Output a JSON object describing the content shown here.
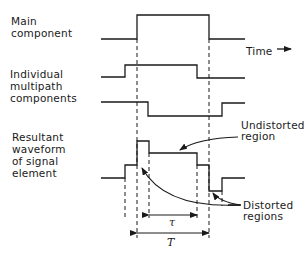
{
  "labels": {
    "main_component": "Main\ncomponent",
    "multipath_components": "Individual\nmultipath\ncomponents",
    "resultant_waveform": "Resultant\nwaveform\nof signal\nelement",
    "time_axis": "Time",
    "undistorted_region": "Undistorted\nregion",
    "distorted_regions": "Distorted\nregions",
    "tau_symbol": "τ",
    "T_symbol": "T"
  },
  "waveforms": {
    "main_component": [
      [
        101,
        39
      ],
      [
        137,
        39
      ],
      [
        137,
        15
      ],
      [
        209,
        15
      ],
      [
        209,
        39
      ],
      [
        245,
        39
      ]
    ],
    "multipath_component_1": [
      [
        101,
        77
      ],
      [
        125,
        77
      ],
      [
        125,
        65
      ],
      [
        197,
        65
      ],
      [
        197,
        78
      ],
      [
        245,
        78
      ]
    ],
    "multipath_component_2": [
      [
        101,
        102
      ],
      [
        148,
        102
      ],
      [
        148,
        116
      ],
      [
        222,
        116
      ],
      [
        222,
        103
      ],
      [
        245,
        103
      ]
    ],
    "resultant": [
      [
        101,
        178
      ],
      [
        125,
        178
      ],
      [
        125,
        165
      ],
      [
        137,
        165
      ],
      [
        137,
        141
      ],
      [
        149,
        141
      ],
      [
        149,
        153
      ],
      [
        197,
        153
      ],
      [
        197,
        165
      ],
      [
        209,
        165
      ],
      [
        209,
        191
      ],
      [
        222,
        191
      ],
      [
        222,
        178
      ],
      [
        245,
        178
      ]
    ]
  },
  "dashed_guides": [
    {
      "x": 137,
      "y1": 39,
      "y2": 238
    },
    {
      "x": 209,
      "y1": 39,
      "y2": 238
    },
    {
      "x": 125,
      "y1": 178,
      "y2": 218
    },
    {
      "x": 149,
      "y1": 153,
      "y2": 218
    },
    {
      "x": 197,
      "y1": 165,
      "y2": 218
    },
    {
      "x": 222,
      "y1": 191,
      "y2": 206
    }
  ],
  "dimensions": {
    "tau": {
      "x1": 149,
      "x2": 197,
      "y": 215
    },
    "T": {
      "x1": 137,
      "x2": 209,
      "y": 233
    }
  },
  "colors": {
    "ink": "#1a1a1a",
    "background": "#ffffff"
  }
}
